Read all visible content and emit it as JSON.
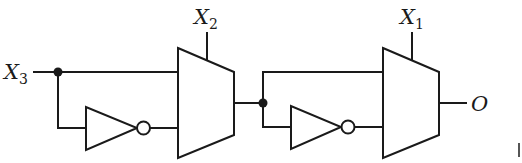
{
  "diagram": {
    "type": "logic-circuit",
    "colors": {
      "stroke": "#1a1a1a",
      "background": "#ffffff"
    },
    "inputs": [
      {
        "id": "x3",
        "label": "X",
        "subscript": "3"
      },
      {
        "id": "x2",
        "label": "X",
        "subscript": "2"
      },
      {
        "id": "x1",
        "label": "X",
        "subscript": "1"
      }
    ],
    "output": {
      "id": "o",
      "label": "O"
    },
    "components": [
      {
        "id": "inv1",
        "type": "NOT",
        "input": "X3",
        "output": "mux1.in1"
      },
      {
        "id": "mux1",
        "type": "MUX2",
        "in0": "X3",
        "in1": "NOT X3",
        "select": "X2"
      },
      {
        "id": "inv2",
        "type": "NOT",
        "input": "mux1.out",
        "output": "mux2.in1"
      },
      {
        "id": "mux2",
        "type": "MUX2",
        "in0": "mux1.out",
        "in1": "NOT mux1.out",
        "select": "X1",
        "out": "O"
      }
    ],
    "junctions": [
      "X3 fan-out",
      "mux1 output fan-out"
    ]
  }
}
